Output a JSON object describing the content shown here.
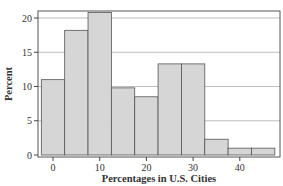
{
  "chart_data": {
    "type": "bar",
    "subtype": "histogram",
    "title": "",
    "xlabel": "Percentages in U.S. Cities",
    "ylabel": "Percent",
    "bin_width": 5,
    "bin_edges": [
      -2.5,
      2.5,
      7.5,
      12.5,
      17.5,
      22.5,
      27.5,
      32.5,
      37.5,
      42.5,
      47.5
    ],
    "categories": [
      "0",
      "5",
      "10",
      "15",
      "20",
      "25",
      "30",
      "35",
      "40",
      "45"
    ],
    "values": [
      11,
      18.2,
      20.8,
      9.8,
      8.5,
      13.3,
      13.3,
      2.3,
      1,
      1
    ],
    "xticks": [
      0,
      10,
      20,
      30,
      40
    ],
    "xtick_labels": [
      "0",
      "10",
      "20",
      "30",
      "40"
    ],
    "yticks": [
      0,
      5,
      10,
      15,
      20
    ],
    "ytick_labels": [
      "0",
      "5",
      "10",
      "15",
      "20"
    ],
    "xlim": [
      -3.5,
      48
    ],
    "ylim": [
      0,
      21.5
    ],
    "grid": "horizontal",
    "legend": null,
    "colors": {
      "bar_fill": "#d6d6d6",
      "bar_edge": "#555555",
      "grid": "#bdbdbd",
      "axis": "#444444"
    }
  }
}
